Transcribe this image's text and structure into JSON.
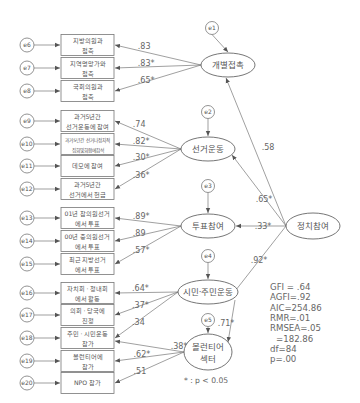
{
  "diagram": {
    "type": "structural-equation-model",
    "second_order_factor": {
      "id": "F",
      "label": "정치참여"
    },
    "factors": [
      {
        "id": "F1",
        "label": "개별접촉",
        "error": "e1",
        "loading_from_F": ".58"
      },
      {
        "id": "F2",
        "label": "선거운동",
        "error": "e2",
        "loading_from_F": ".65*"
      },
      {
        "id": "F3",
        "label": "투표참여",
        "error": "e3",
        "loading_from_F": ".33*"
      },
      {
        "id": "F4",
        "label": "시민·주민운동",
        "error": "e4",
        "loading_from_F": ".92*"
      },
      {
        "id": "F5",
        "label": [
          "볼런티어",
          "섹터"
        ],
        "error": "e5",
        "path_from_F4": ".71*"
      }
    ],
    "indicators": [
      {
        "error": "e6",
        "lines": [
          "지방의원과",
          "접촉"
        ],
        "factor": "F1",
        "loading": ".83"
      },
      {
        "error": "e7",
        "lines": [
          "지역명망가와",
          "접촉"
        ],
        "factor": "F1",
        "loading": ".83*"
      },
      {
        "error": "e8",
        "lines": [
          "국회의원과",
          "접촉"
        ],
        "factor": "F1",
        "loading": ".65*"
      },
      {
        "error": "e9",
        "lines": [
          "과거5년간",
          "선거운동에 참여"
        ],
        "factor": "F2",
        "loading": ".74"
      },
      {
        "error": "e10",
        "lines": [
          "과거5년간 선거나정치적",
          "집회및회합에참석"
        ],
        "factor": "F2",
        "loading": ".82*"
      },
      {
        "error": "e11",
        "lines": [
          "데모에 참여"
        ],
        "factor": "F2",
        "loading": ".30*"
      },
      {
        "error": "e12",
        "lines": [
          "과거5년간",
          "선거에서 헌금"
        ],
        "factor": "F2",
        "loading": ".36*"
      },
      {
        "error": "e13",
        "lines": [
          "01년 참의원선거",
          "에서  투표"
        ],
        "factor": "F3",
        "loading": ".89*"
      },
      {
        "error": "e14",
        "lines": [
          "00년 중의원선거",
          "에서  투표"
        ],
        "factor": "F3",
        "loading": ".89"
      },
      {
        "error": "e15",
        "lines": [
          "최근 지방선거",
          "에서 투표"
        ],
        "factor": "F3",
        "loading": ".57*"
      },
      {
        "error": "e16",
        "lines": [
          "자치회 · 청내회",
          "에서 활동"
        ],
        "factor": "F4",
        "loading": ".64*"
      },
      {
        "error": "e17",
        "lines": [
          "의회 · 당국에",
          "진정"
        ],
        "factor": "F4",
        "loading": ".37*"
      },
      {
        "error": "e18",
        "lines": [
          "주민 · 시민운동",
          "참가"
        ],
        "factor": "F4",
        "loading": ".34"
      },
      {
        "error": "e19",
        "lines": [
          "볼런티어에",
          "참가"
        ],
        "factor": "F5",
        "loading": ".62*"
      },
      {
        "error": "e20",
        "lines": [
          "NPO 참가"
        ],
        "factor": "F5",
        "loading": ".51"
      }
    ],
    "cross_path": {
      "from": "F5",
      "to": "e18-indicator",
      "value": ".38*"
    },
    "fit_indices": [
      "GFI = .64",
      "AGFI=.92",
      "AIC=254.86",
      "RMR=.01",
      "RMSEA=.05",
      "=182.86",
      "df=84",
      "p=.00"
    ],
    "note": "* : p < 0.05"
  }
}
